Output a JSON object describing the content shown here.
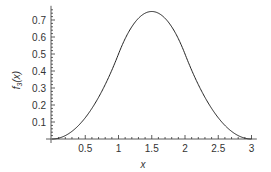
{
  "chart_data": {
    "type": "line",
    "title": "",
    "xlabel": "x",
    "ylabel": "f3(x)",
    "ylabel_main": "f",
    "ylabel_sub": "3",
    "ylabel_tail": "(x)",
    "xlim": [
      0,
      3.05
    ],
    "ylim": [
      0,
      0.76
    ],
    "grid": false,
    "legend": null,
    "x_ticks": [
      0.5,
      1,
      1.5,
      2,
      2.5,
      3
    ],
    "x_tick_labels": [
      "0.5",
      "1",
      "1.5",
      "2",
      "2.5",
      "3"
    ],
    "y_ticks": [
      0.1,
      0.2,
      0.3,
      0.4,
      0.5,
      0.6,
      0.7
    ],
    "y_tick_labels": [
      "0.1",
      "0.2",
      "0.3",
      "0.4",
      "0.5",
      "0.6",
      "0.7"
    ],
    "series": [
      {
        "name": "f3(x)",
        "color": "#222222",
        "x": [
          0,
          0.1,
          0.2,
          0.3,
          0.4,
          0.5,
          0.6,
          0.7,
          0.8,
          0.9,
          1.0,
          1.1,
          1.2,
          1.3,
          1.4,
          1.5,
          1.6,
          1.7,
          1.8,
          1.9,
          2.0,
          2.1,
          2.2,
          2.3,
          2.4,
          2.5,
          2.6,
          2.7,
          2.8,
          2.9,
          3.0
        ],
        "values": [
          0,
          0.005,
          0.02,
          0.045,
          0.08,
          0.125,
          0.18,
          0.245,
          0.32,
          0.405,
          0.5,
          0.58,
          0.64,
          0.68,
          0.74,
          0.75,
          0.74,
          0.68,
          0.64,
          0.58,
          0.5,
          0.405,
          0.32,
          0.245,
          0.18,
          0.125,
          0.08,
          0.045,
          0.02,
          0.005,
          0
        ]
      }
    ]
  }
}
